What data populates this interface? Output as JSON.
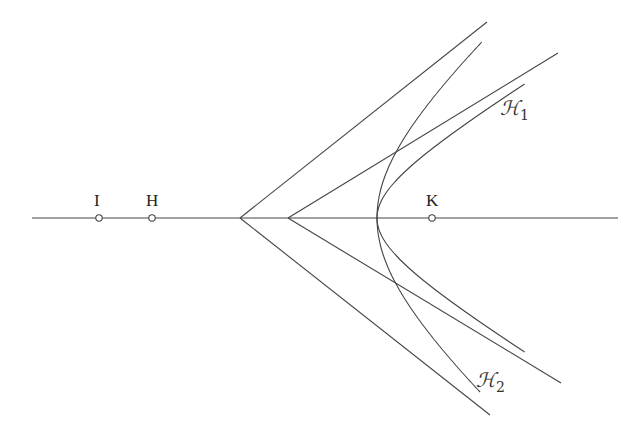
{
  "diagram": {
    "axis": {
      "x1": 32,
      "x2": 618,
      "y": 218
    },
    "points": [
      {
        "label": "I",
        "x": 99,
        "y": 218
      },
      {
        "label": "H",
        "x": 152,
        "y": 218
      },
      {
        "label": "K",
        "x": 432,
        "y": 218
      }
    ],
    "asymptote_vertices": [
      {
        "x": 240,
        "y": 218,
        "ends": [
          [
            487,
            22
          ],
          [
            490,
            415
          ]
        ]
      },
      {
        "x": 288,
        "y": 218,
        "ends": [
          [
            558,
            53
          ],
          [
            561,
            383
          ]
        ]
      }
    ],
    "curves": [
      {
        "name": "H1",
        "label": "ℋ",
        "subscript": "1",
        "center_x": 288,
        "a": 89,
        "b": 54.4,
        "y_top": 84,
        "y_bottom": 352,
        "label_x": 500,
        "label_y": 96
      },
      {
        "name": "H2",
        "label": "ℋ",
        "subscript": "2",
        "center_x": 240,
        "a": 137,
        "b": 121,
        "y_top": 42,
        "y_bottom": 393,
        "label_x": 476,
        "label_y": 368
      }
    ],
    "colors": {
      "line": "#444444",
      "background": "#ffffff"
    }
  }
}
